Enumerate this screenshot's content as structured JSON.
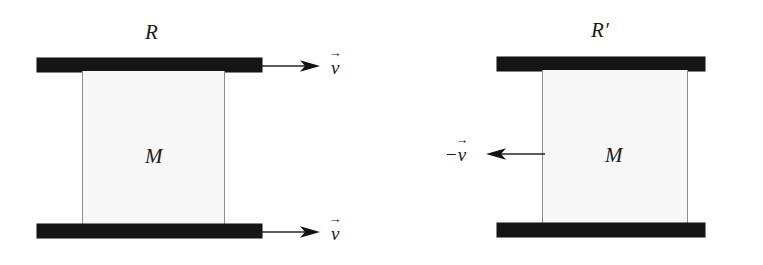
{
  "figure": {
    "width": 763,
    "height": 265,
    "background": "#ffffff",
    "plate_color": "#151515",
    "box_fill": "#f7f7f7",
    "box_edge": "#8d8d8d",
    "ink_color": "#1b1b1b"
  },
  "panels": [
    {
      "id": "left",
      "frame_label": "R",
      "frame_prime": "",
      "mass_label": "M",
      "arrows": [
        {
          "id": "top",
          "direction": "right",
          "label_minus": "",
          "label_symbol": "v",
          "label_accent": "→"
        },
        {
          "id": "bottom",
          "direction": "right",
          "label_minus": "",
          "label_symbol": "v",
          "label_accent": "→"
        }
      ]
    },
    {
      "id": "right",
      "frame_label": "R",
      "frame_prime": "′",
      "mass_label": "M",
      "arrows": [
        {
          "id": "middle",
          "direction": "left",
          "label_minus": "−",
          "label_symbol": "v",
          "label_accent": "→"
        }
      ]
    }
  ]
}
